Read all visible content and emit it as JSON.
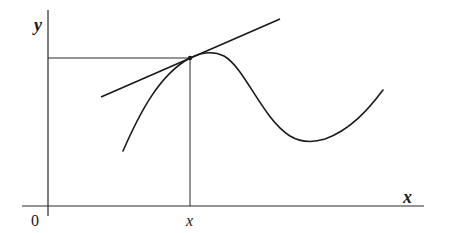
{
  "diagram": {
    "type": "function-graph-with-tangent",
    "labels": {
      "y_axis": "y",
      "x_axis": "x",
      "origin": "0",
      "point_x": "x"
    },
    "colors": {
      "ink": "#1a1a1a",
      "background": "#ffffff"
    },
    "elements": [
      "y-axis",
      "x-axis",
      "curve",
      "tangent-line",
      "point-of-tangency",
      "horizontal-guide-to-y-axis",
      "vertical-guide-to-x-axis"
    ]
  }
}
